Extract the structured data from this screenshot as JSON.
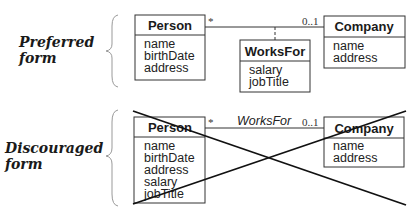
{
  "preferred": {
    "label_line1": "Preferred",
    "label_line2": "form",
    "person": {
      "name": "Person",
      "attributes": [
        "name",
        "birthDate",
        "address"
      ]
    },
    "company": {
      "name": "Company",
      "attributes": [
        "name",
        "address"
      ]
    },
    "association_class": {
      "name": "WorksFor",
      "attributes": [
        "salary",
        "jobTitle"
      ]
    },
    "multiplicity_person_end": "*",
    "multiplicity_company_end": "0..1"
  },
  "discouraged": {
    "label_line1": "Discouraged",
    "label_line2": "form",
    "person": {
      "name": "Person",
      "attributes": [
        "name",
        "birthDate",
        "address",
        "salary",
        "jobTitle"
      ]
    },
    "company": {
      "name": "Company",
      "attributes": [
        "name",
        "address"
      ]
    },
    "association_name": "WorksFor",
    "multiplicity_person_end": "*",
    "multiplicity_company_end": "0..1",
    "crossed_out": true
  }
}
